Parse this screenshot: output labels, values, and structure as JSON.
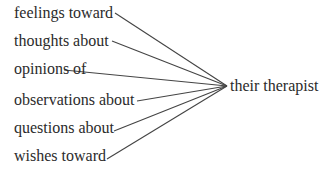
{
  "diagram": {
    "target": "their therapist",
    "sources": [
      {
        "label": "feelings toward",
        "x": 14,
        "y": 4,
        "lx": 115,
        "ly": 13
      },
      {
        "label": "thoughts about",
        "x": 14,
        "y": 32,
        "lx": 112,
        "ly": 41
      },
      {
        "label": "opinions of",
        "x": 14,
        "y": 60,
        "lx": 64,
        "ly": 70
      },
      {
        "label": "observations about",
        "x": 14,
        "y": 91,
        "lx": 137,
        "ly": 101
      },
      {
        "label": "questions about",
        "x": 14,
        "y": 119,
        "lx": 114,
        "ly": 131
      },
      {
        "label": "wishes toward",
        "x": 14,
        "y": 147,
        "lx": 107,
        "ly": 159
      }
    ],
    "hub": {
      "x": 227,
      "y": 86
    },
    "line_color": "#444444"
  }
}
